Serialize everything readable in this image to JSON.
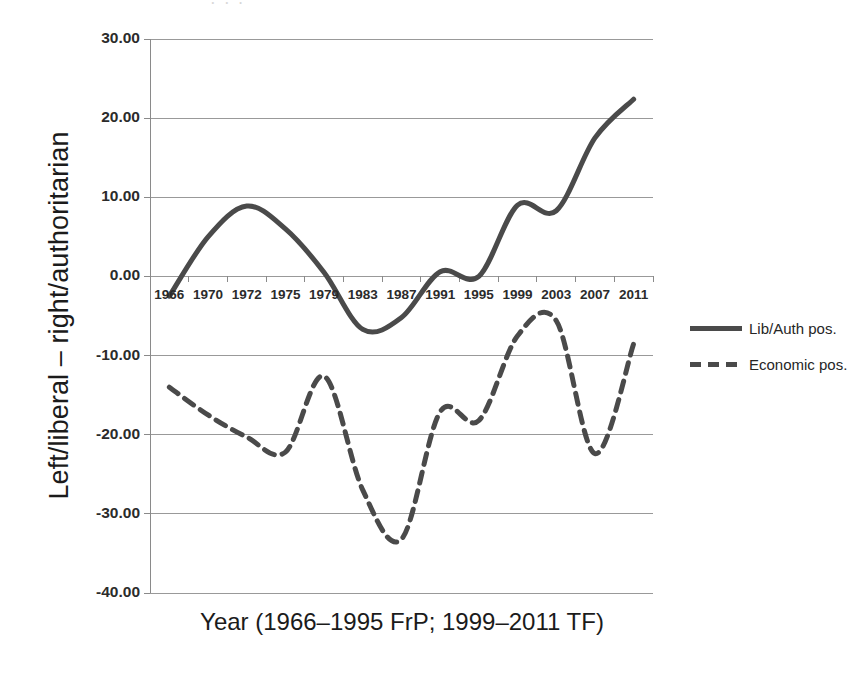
{
  "chart_data": {
    "type": "line",
    "title": "",
    "xlabel": "Year (1966–1995 FrP; 1999–2011 TF)",
    "ylabel": "Left/liberal – right/authoritarian",
    "ylim": [
      -40,
      30
    ],
    "yticks": [
      30,
      20,
      10,
      0,
      -10,
      -20,
      -30,
      -40
    ],
    "ytick_labels": [
      "30.00",
      "20.00",
      "10.00",
      "0.00",
      "-10.00",
      "-20.00",
      "-30.00",
      "-40.00"
    ],
    "xlim": [
      1966,
      2011
    ],
    "categories": [
      1966,
      1970,
      1972,
      1975,
      1979,
      1983,
      1987,
      1991,
      1995,
      1999,
      2003,
      2007,
      2011
    ],
    "xtick_labels": [
      "1966",
      "1970",
      "1972",
      "1975",
      "1979",
      "1983",
      "1987",
      "1991",
      "1995",
      "1999",
      "2003",
      "2007",
      "2011"
    ],
    "grid": "horizontal",
    "legend_position": "right",
    "series": [
      {
        "name": "Lib/Auth pos.",
        "style": "solid",
        "color": "#4a4a4a",
        "x": [
          1966,
          1970,
          1972,
          1975,
          1979,
          1983,
          1987,
          1991,
          1995,
          1999,
          2003,
          2007,
          2011
        ],
        "values": [
          -2.5,
          5.0,
          8.9,
          6.0,
          0.5,
          -6.7,
          -5.2,
          0.6,
          0.0,
          9.0,
          8.3,
          17.5,
          22.4
        ]
      },
      {
        "name": "Economic pos.",
        "style": "dashed",
        "color": "#4a4a4a",
        "x": [
          1966,
          1970,
          1972,
          1975,
          1979,
          1983,
          1987,
          1991,
          1995,
          1999,
          2003,
          2007,
          2011
        ],
        "values": [
          -14.0,
          -17.5,
          -20.3,
          -22.2,
          -12.6,
          -27.0,
          -33.2,
          -17.1,
          -18.2,
          -7.5,
          -5.6,
          -22.4,
          -8.5
        ]
      }
    ],
    "annotations": []
  },
  "legend": {
    "items": [
      {
        "label": "Lib/Auth pos.",
        "style": "solid"
      },
      {
        "label": "Economic pos.",
        "style": "dashed"
      }
    ]
  },
  "scan": {
    "smudge_text": "· · ·"
  }
}
